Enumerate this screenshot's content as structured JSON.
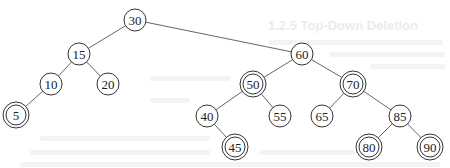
{
  "background_text": {
    "heading": "1.2.5 Top-Down Deletion"
  },
  "tree": {
    "type": "binary-search-tree",
    "node_radius": 11,
    "nodes": [
      {
        "id": "n30",
        "label": "30",
        "x": 135,
        "y": 20,
        "double": false
      },
      {
        "id": "n15",
        "label": "15",
        "x": 79,
        "y": 54,
        "double": false
      },
      {
        "id": "n60",
        "label": "60",
        "x": 302,
        "y": 54,
        "double": false
      },
      {
        "id": "n10",
        "label": "10",
        "x": 51,
        "y": 84,
        "double": false
      },
      {
        "id": "n20",
        "label": "20",
        "x": 108,
        "y": 84,
        "double": false
      },
      {
        "id": "n50",
        "label": "50",
        "x": 253,
        "y": 84,
        "double": true
      },
      {
        "id": "n70",
        "label": "70",
        "x": 353,
        "y": 84,
        "double": true
      },
      {
        "id": "n5",
        "label": "5",
        "x": 16,
        "y": 115,
        "double": true
      },
      {
        "id": "n40",
        "label": "40",
        "x": 207,
        "y": 116,
        "double": false
      },
      {
        "id": "n55",
        "label": "55",
        "x": 280,
        "y": 116,
        "double": false
      },
      {
        "id": "n65",
        "label": "65",
        "x": 322,
        "y": 116,
        "double": false
      },
      {
        "id": "n85",
        "label": "85",
        "x": 400,
        "y": 116,
        "double": false
      },
      {
        "id": "n45",
        "label": "45",
        "x": 235,
        "y": 147,
        "double": true
      },
      {
        "id": "n80",
        "label": "80",
        "x": 369,
        "y": 147,
        "double": true
      },
      {
        "id": "n90",
        "label": "90",
        "x": 430,
        "y": 147,
        "double": true
      }
    ],
    "edges": [
      [
        "n30",
        "n15"
      ],
      [
        "n30",
        "n60"
      ],
      [
        "n15",
        "n10"
      ],
      [
        "n15",
        "n20"
      ],
      [
        "n10",
        "n5"
      ],
      [
        "n60",
        "n50"
      ],
      [
        "n60",
        "n70"
      ],
      [
        "n50",
        "n40"
      ],
      [
        "n50",
        "n55"
      ],
      [
        "n40",
        "n45"
      ],
      [
        "n70",
        "n65"
      ],
      [
        "n70",
        "n85"
      ],
      [
        "n85",
        "n80"
      ],
      [
        "n85",
        "n90"
      ]
    ]
  }
}
